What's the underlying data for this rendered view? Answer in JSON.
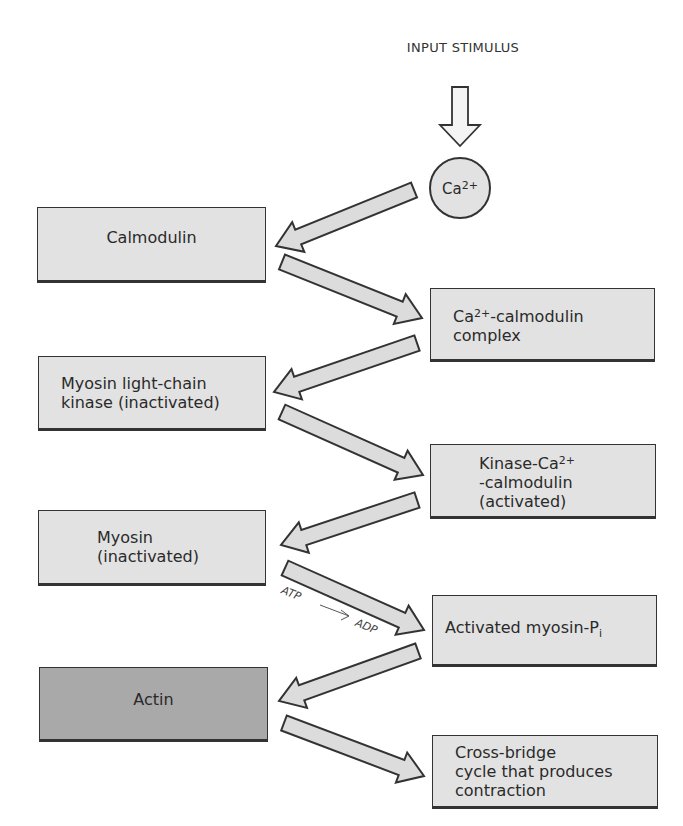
{
  "title": "INPUT STIMULUS",
  "ion": {
    "base": "Ca",
    "charge": "2+"
  },
  "boxes": {
    "calmodulin": "Calmodulin",
    "complex": {
      "pre": "Ca",
      "sup": "2+",
      "post": "-calmodulin\ncomplex"
    },
    "mlck": "Myosin light-chain\nkinase (inactivated)",
    "kinase_complex": {
      "pre": "Kinase-Ca",
      "sup": "2+",
      "post": "\n-calmodulin\n(activated)"
    },
    "myosin": "Myosin\n(inactivated)",
    "activated_myosin": {
      "pre": "Activated myosin-P",
      "sub": "i"
    },
    "actin": "Actin",
    "cross_bridge": "Cross-bridge\ncycle that produces\ncontraction"
  },
  "annotations": {
    "atp": "ATP",
    "adp": "ADP"
  },
  "colors": {
    "box_fill": "#e2e2e2",
    "actin_fill": "#a9a9a9",
    "outline": "#333333",
    "arrow_fill": "#dcdcdc"
  }
}
